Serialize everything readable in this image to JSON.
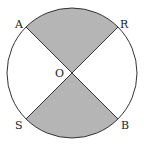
{
  "diagram": {
    "labels": {
      "A": "A",
      "R": "R",
      "S": "S",
      "B": "B",
      "O": "O"
    },
    "colors": {
      "shade": "#b5b5b5",
      "stroke": "#333333"
    }
  }
}
